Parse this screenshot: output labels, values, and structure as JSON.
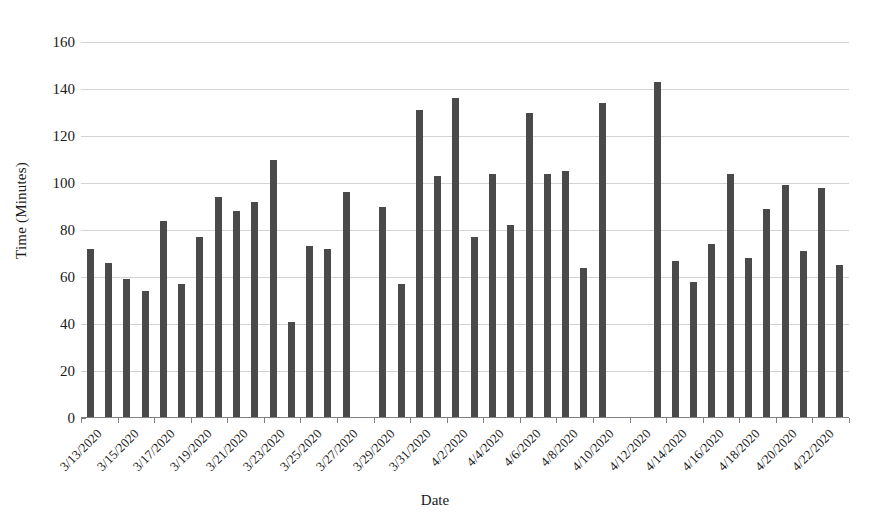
{
  "chart_data": {
    "type": "bar",
    "title": "",
    "xlabel": "Date",
    "ylabel": "Time (Minutes)",
    "ylim": [
      0,
      160
    ],
    "yticks": [
      0,
      20,
      40,
      60,
      80,
      100,
      120,
      140,
      160
    ],
    "grid": true,
    "legend": "none",
    "bar_color": "#4a4a4a",
    "gridline_color": "#d3d3d3",
    "axis_color": "#808080",
    "categories": [
      "3/13/2020",
      "3/14/2020",
      "3/15/2020",
      "3/16/2020",
      "3/17/2020",
      "3/18/2020",
      "3/19/2020",
      "3/20/2020",
      "3/21/2020",
      "3/22/2020",
      "3/23/2020",
      "3/24/2020",
      "3/25/2020",
      "3/26/2020",
      "3/27/2020",
      "3/28/2020",
      "3/29/2020",
      "3/30/2020",
      "3/31/2020",
      "4/1/2020",
      "4/2/2020",
      "4/3/2020",
      "4/4/2020",
      "4/5/2020",
      "4/6/2020",
      "4/7/2020",
      "4/8/2020",
      "4/9/2020",
      "4/10/2020",
      "4/11/2020",
      "4/12/2020",
      "4/13/2020",
      "4/14/2020",
      "4/15/2020",
      "4/16/2020",
      "4/17/2020",
      "4/18/2020",
      "4/19/2020",
      "4/20/2020",
      "4/21/2020",
      "4/22/2020",
      "4/23/2020"
    ],
    "values": [
      72,
      66,
      59,
      54,
      84,
      57,
      77,
      94,
      88,
      92,
      110,
      41,
      73,
      72,
      96,
      null,
      90,
      57,
      131,
      103,
      136,
      77,
      104,
      82,
      130,
      104,
      105,
      64,
      134,
      null,
      null,
      143,
      67,
      58,
      74,
      104,
      68,
      89,
      99,
      71,
      98,
      65
    ],
    "tick_labels": [
      "3/13/2020",
      "3/15/2020",
      "3/17/2020",
      "3/19/2020",
      "3/21/2020",
      "3/23/2020",
      "3/25/2020",
      "3/27/2020",
      "3/29/2020",
      "3/31/2020",
      "4/2/2020",
      "4/4/2020",
      "4/6/2020",
      "4/8/2020",
      "4/10/2020",
      "4/12/2020",
      "4/14/2020",
      "4/16/2020",
      "4/18/2020",
      "4/20/2020",
      "4/22/2020"
    ],
    "tick_label_indices": [
      0,
      2,
      4,
      6,
      8,
      10,
      12,
      14,
      16,
      18,
      20,
      22,
      24,
      26,
      28,
      30,
      32,
      34,
      36,
      38,
      40
    ]
  }
}
